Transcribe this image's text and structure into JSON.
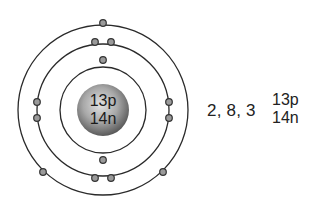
{
  "diagram": {
    "nucleus": {
      "protons_label": "13p",
      "neutrons_label": "14n",
      "color_center": "#dcdcdc",
      "color_edge": "#5a5a5a"
    },
    "shells": [
      {
        "name": "shell-1",
        "radius": 43,
        "electrons": 2
      },
      {
        "name": "shell-2",
        "radius": 66,
        "electrons": 8
      },
      {
        "name": "shell-3",
        "radius": 85,
        "electrons": 3
      }
    ],
    "electron_configuration": "2, 8, 3",
    "side_label": {
      "protons": "13p",
      "neutrons": "14n"
    },
    "colors": {
      "orbit": "#2a2a2a",
      "electron_fill": "#9a9a9a",
      "electron_stroke": "#333333",
      "text": "#222222"
    }
  }
}
